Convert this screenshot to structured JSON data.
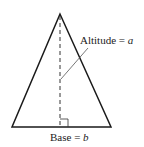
{
  "diagram": {
    "altitude_label": {
      "text": "Altitude = ",
      "var": "a"
    },
    "base_label": {
      "text": "Base = ",
      "var": "b"
    },
    "colors": {
      "stroke": "#1a1a1a",
      "leader": "#555555",
      "background": "#ffffff"
    }
  }
}
